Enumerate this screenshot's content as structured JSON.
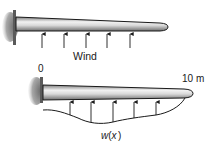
{
  "figure": {
    "top_panel": {
      "wind_label": "Wind",
      "arrow_count": 5
    },
    "bottom_panel": {
      "origin_label": "0",
      "length_label": "10 m",
      "load_label_fn": "w",
      "load_label_open": "(",
      "load_label_var": "x",
      "load_label_close": ")",
      "arrow_count": 5
    },
    "colors": {
      "beam_light": "#e6e6e6",
      "beam_dark": "#8c8c8c",
      "outline": "#1a1a1a",
      "wall": "#7a7a7a"
    }
  }
}
